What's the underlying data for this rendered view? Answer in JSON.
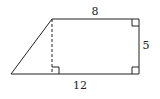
{
  "figure": {
    "type": "right-trapezoid",
    "labels": {
      "top": "8",
      "right": "5",
      "bottom": "12"
    },
    "has_dashed_height": true,
    "right_angle_markers": 3,
    "stroke_color": "#222222"
  }
}
